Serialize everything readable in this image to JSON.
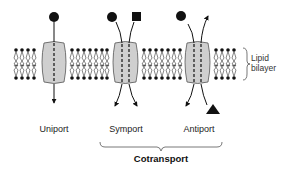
{
  "figure": {
    "membrane_label_line1": "Lipid",
    "membrane_label_line2": "bilayer",
    "transporters": [
      {
        "label": "Uniport",
        "molecules": [
          "circle"
        ],
        "direction": "inward"
      },
      {
        "label": "Symport",
        "molecules": [
          "circle",
          "square"
        ],
        "direction": "both inward"
      },
      {
        "label": "Antiport",
        "molecules": [
          "circle",
          "triangle"
        ],
        "direction": "opposite"
      }
    ],
    "group_label": "Cotransport",
    "colors": {
      "protein_fill": "#cfcfcf",
      "protein_stroke": "#555555",
      "ink": "#111111"
    }
  }
}
